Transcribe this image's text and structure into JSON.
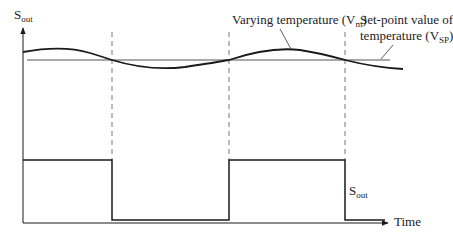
{
  "labels": {
    "y_axis_main": "S",
    "y_axis_sub": "out",
    "varying_main": "Varying temperature (V",
    "varying_sub": "m",
    "varying_close": ")",
    "setpoint_line1": "Set-point value of",
    "setpoint_line2_main": "temperature (V",
    "setpoint_line2_sub": "SP",
    "setpoint_line2_close": ")",
    "signal_main": "S",
    "signal_sub": "out",
    "x_axis": "Time"
  },
  "colors": {
    "line": "#1a1a1a",
    "dashed": "#777777",
    "setpoint": "#555555",
    "background": "#ffffff"
  },
  "diagram": {
    "type": "on-off controller timing diagram",
    "curves": [
      {
        "name": "varying-temperature",
        "shape": "sinusoid oscillating about set-point"
      },
      {
        "name": "set-point",
        "shape": "horizontal line"
      },
      {
        "name": "s-out",
        "shape": "square wave: high, low, high, low"
      }
    ],
    "crossings": 3
  }
}
